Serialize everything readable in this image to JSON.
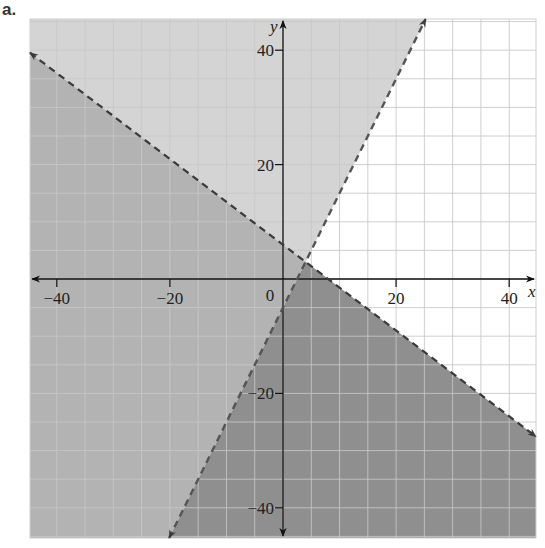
{
  "part_label": "a.",
  "colors": {
    "region_above_both": "#d4d4d4",
    "region_left_below_line1": "#b3b3b3",
    "region_below_both": "#8f8f8f",
    "region_right_wedge": "#ffffff",
    "grid": "#c8c8c8",
    "grid_on_dark": "#bdbdbd",
    "boundary": "#3a3a3a",
    "axis": "#111111"
  },
  "chart_data": {
    "type": "area",
    "title": "",
    "xlabel": "x",
    "ylabel": "y",
    "xlim": [
      -44.5,
      44.5
    ],
    "ylim": [
      -45.5,
      45.5
    ],
    "grid": true,
    "grid_step": 5,
    "x_ticks": [
      -40,
      -20,
      20,
      40
    ],
    "y_ticks": [
      40,
      20,
      -20,
      -40
    ],
    "origin_label": "0",
    "boundary_lines": [
      {
        "name": "line1",
        "equation": "y = -3/4 x + 6",
        "slope": -0.75,
        "intercept": 6,
        "style": "dashed",
        "arrows": "both"
      },
      {
        "name": "line2",
        "equation": "y = 2x - 5",
        "slope": 2,
        "intercept": -5,
        "style": "dashed",
        "arrows": "both"
      }
    ],
    "intersection": [
      4,
      3
    ],
    "shaded_regions": [
      {
        "name": "above both lines",
        "shade": "light"
      },
      {
        "name": "left of line2 and below line1",
        "shade": "medium"
      },
      {
        "name": "below both lines",
        "shade": "dark",
        "inequalities": [
          "y < -3/4 x + 6",
          "y < 2x - 5"
        ]
      },
      {
        "name": "right wedge (below line2, above line1)",
        "shade": "none"
      }
    ]
  }
}
